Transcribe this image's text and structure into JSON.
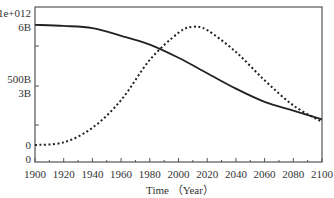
{
  "chart_data": {
    "type": "line",
    "title": "",
    "xlabel": "Time （Year）",
    "ylabel": "",
    "xlim": [
      1900,
      2100
    ],
    "x_ticks": [
      1900,
      1920,
      1940,
      1960,
      1980,
      2000,
      2020,
      2040,
      2060,
      2080,
      2100
    ],
    "y_tick_labels": [
      {
        "label": "1e+012",
        "axis": "dashed"
      },
      {
        "label": "6B",
        "axis": "solid"
      },
      {
        "label": "500B",
        "axis": "dashed"
      },
      {
        "label": "3B",
        "axis": "solid"
      },
      {
        "label": "0",
        "axis": "dashed"
      },
      {
        "label": "0",
        "axis": "solid"
      }
    ],
    "axes": {
      "solid": {
        "ylim": [
          0,
          6
        ],
        "unit": "B"
      },
      "dashed": {
        "ylim": [
          0,
          1000
        ],
        "unit": "B"
      }
    },
    "grid": false,
    "legend": null,
    "series": [
      {
        "name": "solid",
        "style": "solid",
        "axis": "solid",
        "x": [
          1900,
          1920,
          1940,
          1960,
          1980,
          2000,
          2020,
          2040,
          2060,
          2080,
          2100
        ],
        "values": [
          6.1,
          6.05,
          5.95,
          5.6,
          5.2,
          4.6,
          3.9,
          3.2,
          2.6,
          2.2,
          1.8
        ]
      },
      {
        "name": "dashed",
        "style": "dotted",
        "axis": "dashed",
        "x": [
          1900,
          1920,
          1940,
          1960,
          1980,
          2000,
          2010,
          2020,
          2040,
          2060,
          2080,
          2100
        ],
        "values": [
          0,
          20,
          130,
          340,
          645,
          850,
          895,
          870,
          705,
          490,
          300,
          175
        ]
      }
    ]
  },
  "layout": {
    "plot": {
      "left": 35,
      "top": 7,
      "right": 322,
      "bottom": 162
    },
    "y_label_positions": [
      13,
      27,
      79,
      93,
      145,
      159
    ],
    "y_tick_marks": [
      46,
      86,
      125
    ],
    "solid_axis_px": {
      "zero": 159,
      "top_value": 6,
      "top_px": 27
    },
    "dashed_axis_px": {
      "zero": 145,
      "top_value": 1000,
      "top_px": 13
    },
    "colors": {
      "axis": "#555555",
      "line": "#222222",
      "text": "#333333"
    }
  }
}
